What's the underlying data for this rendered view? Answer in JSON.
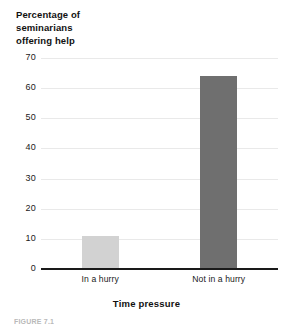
{
  "chart_data": {
    "type": "bar",
    "title": "",
    "subtitle": "",
    "categories": [
      "In a hurry",
      "Not in a hurry"
    ],
    "values": [
      11,
      64
    ],
    "series": [
      {
        "name": "Percentage of seminarians offering help",
        "values": [
          11,
          64
        ]
      }
    ],
    "xlabel": "Time pressure",
    "ylabel": "Percentage of seminarians offering help",
    "ylabel_lines": [
      "Percentage of",
      "seminarians",
      "offering help"
    ],
    "ylim": [
      0,
      70
    ],
    "yticks": [
      0,
      10,
      20,
      30,
      40,
      50,
      60,
      70
    ],
    "ytick_labels": [
      "0",
      "10",
      "20",
      "30",
      "40",
      "50",
      "60",
      "70"
    ],
    "grid": true,
    "grid_axis": "y",
    "legend": false,
    "legend_position": "none",
    "bar_colors": [
      "#d2d2d2",
      "#6f6f6f"
    ],
    "axis_color": "#1a1a1a",
    "gridline_color": "#e9e9e9"
  },
  "caption": {
    "text": "FIGURE 7.1"
  }
}
